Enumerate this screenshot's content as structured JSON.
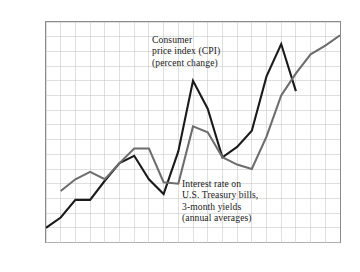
{
  "figure": {
    "name": "cpi-and-treasury-bill-rate-line-chart"
  },
  "axes": {
    "y_unit_label": "15%",
    "y_ticks": [
      "15%",
      "14",
      "13",
      "12",
      "11",
      "10",
      "9",
      "8",
      "7",
      "6",
      "5",
      "4",
      "3",
      "2",
      "1",
      "0"
    ],
    "x_ticks": [
      "1964",
      "65",
      "66",
      "67",
      "68",
      "69",
      "70",
      "71",
      "72",
      "73",
      "74",
      "75",
      "76",
      "77",
      "78",
      "79",
      "80",
      "81",
      "82",
      "83",
      "84"
    ]
  },
  "annotations": {
    "cpi": {
      "line1": "Consumer",
      "line2": "price index (CPI)",
      "line3": "(percent change)"
    },
    "tbill": {
      "line1": "Interest rate on",
      "line2": "U.S. Treasury bills,",
      "line3": "3-month yields",
      "line4": "(annual averages)"
    }
  },
  "colors": {
    "cpi_line": "#1a1a1a",
    "tbill_line": "#6d6d6d",
    "grid": "#c9c9c9",
    "frame": "#8a8a8a",
    "background": "#ffffff"
  },
  "chart_data": {
    "type": "line",
    "title": "",
    "xlabel": "",
    "ylabel": "",
    "xlim": [
      1964,
      1984
    ],
    "ylim": [
      0,
      15
    ],
    "grid": true,
    "legend": "annotations-inline",
    "x": [
      1964,
      1965,
      1966,
      1967,
      1968,
      1969,
      1970,
      1971,
      1972,
      1973,
      1974,
      1975,
      1976,
      1977,
      1978,
      1979,
      1980,
      1981,
      1982,
      1983,
      1984
    ],
    "series": [
      {
        "name": "Consumer price index (CPI) (percent change)",
        "color": "#1a1a1a",
        "values": [
          1.0,
          1.7,
          2.9,
          2.9,
          4.2,
          5.4,
          5.9,
          4.3,
          3.3,
          6.2,
          11.0,
          9.1,
          5.8,
          6.5,
          7.6,
          11.3,
          13.5,
          10.3,
          null,
          null,
          null
        ]
      },
      {
        "name": "Interest rate on U.S. Treasury bills, 3-month yields (annual averages)",
        "color": "#6d6d6d",
        "values": [
          null,
          3.5,
          4.3,
          4.8,
          4.3,
          5.4,
          6.4,
          6.4,
          4.1,
          4.0,
          7.9,
          7.5,
          5.8,
          5.3,
          5.0,
          7.2,
          10.0,
          11.5,
          12.8,
          13.4,
          14.1
        ]
      }
    ]
  }
}
